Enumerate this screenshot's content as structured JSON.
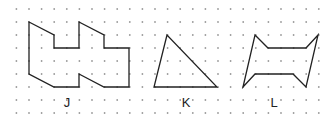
{
  "grid": {
    "x0": 16.4,
    "dx": 12.6,
    "cols": 25,
    "y0": 9,
    "dy": 13,
    "rows": 9,
    "dot_color": "#9a9a9a"
  },
  "shapes": [
    {
      "label": "J",
      "label_x": 67,
      "label_y": 96,
      "points": "29,22 54,35 54,48 79,48 79,22 104,35 104,48 129,48 129,87 104,87 79,74 79,87 54,87 29,74"
    },
    {
      "label": "K",
      "label_x": 186,
      "label_y": 96,
      "points": "167,35 154,87 217,87"
    },
    {
      "label": "L",
      "label_x": 274,
      "label_y": 96,
      "points": "255,35 268,48 306,48 318,35 306,87 293,74 255,74 243,87"
    }
  ],
  "stroke_color": "#222222"
}
